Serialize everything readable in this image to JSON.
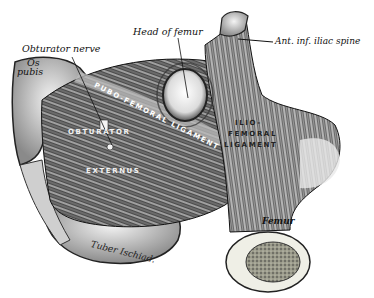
{
  "figure": {
    "labels": {
      "obturator_nerve": "Obturator nerve",
      "os_pubis_line1": "Os",
      "os_pubis_line2": "pubis",
      "head_of_femur": "Head of femur",
      "ant_inf_iliac_spine": "Ant. inf. iliac spine",
      "pubofemoral_ligament": "PUBO-FEMORAL LIGAMENT",
      "obturator": "OBTURATOR",
      "externus": "EXTERNUS",
      "iliofemoral_line1": "ILIO-",
      "iliofemoral_line2": "FEMORAL",
      "iliofemoral_line3": "LIGAMENT",
      "tuber_ischiad": "Tuber Ischiad.",
      "femur": "Femur"
    }
  }
}
